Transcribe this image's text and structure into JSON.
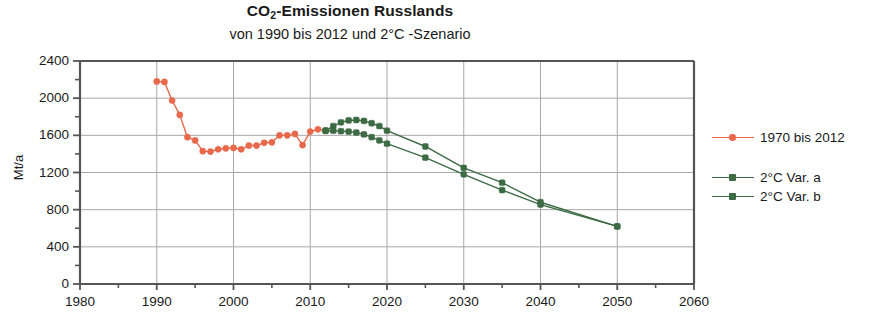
{
  "chart_data": {
    "type": "line",
    "title": "CO2-Emissionen Russlands",
    "title_main": "CO",
    "title_sub": "2",
    "title_rest": "-Emissionen Russlands",
    "subtitle": "von 1990 bis 2012 und 2°C -Szenario",
    "xlabel": "",
    "ylabel": "Mt/a",
    "xlim": [
      1980,
      2060
    ],
    "ylim": [
      0,
      2400
    ],
    "xticks": [
      1980,
      1990,
      2000,
      2010,
      2020,
      2030,
      2040,
      2050,
      2060
    ],
    "xtick_labels": [
      "1980",
      "1990",
      "2000",
      "2010",
      "2020",
      "2030",
      "2040",
      "2050",
      "2060"
    ],
    "xminor_step": 5,
    "yticks": [
      0,
      400,
      800,
      1200,
      1600,
      2000,
      2400
    ],
    "ytick_labels": [
      "0",
      "400",
      "800",
      "1200",
      "1600",
      "2000",
      "2400"
    ],
    "yminor_step": 200,
    "grid": "horizontal-and-vertical-major",
    "legend_position": "right",
    "colors": {
      "historical": "#e8684b",
      "scenario": "#3d6b44",
      "grid": "#a8a8a8",
      "axis": "#555555",
      "background": "#ffffff"
    },
    "series": [
      {
        "name": "1970 bis 2012",
        "color": "#e8684b",
        "x": [
          1990,
          1991,
          1992,
          1993,
          1994,
          1995,
          1996,
          1997,
          1998,
          1999,
          2000,
          2001,
          2002,
          2003,
          2004,
          2005,
          2006,
          2007,
          2008,
          2009,
          2010,
          2011,
          2012
        ],
        "values": [
          2180,
          2175,
          1975,
          1820,
          1580,
          1545,
          1430,
          1425,
          1450,
          1460,
          1465,
          1450,
          1490,
          1490,
          1520,
          1525,
          1600,
          1600,
          1615,
          1495,
          1640,
          1665,
          1650
        ]
      },
      {
        "name": "2°C Var. a",
        "color": "#3d6b44",
        "x": [
          2012,
          2013,
          2014,
          2015,
          2016,
          2017,
          2018,
          2019,
          2020,
          2025,
          2030,
          2035,
          2040,
          2050
        ],
        "values": [
          1650,
          1700,
          1740,
          1760,
          1765,
          1755,
          1730,
          1700,
          1650,
          1480,
          1250,
          1090,
          880,
          620
        ]
      },
      {
        "name": "2°C Var. b",
        "color": "#3d6b44",
        "x": [
          2012,
          2013,
          2014,
          2015,
          2016,
          2017,
          2018,
          2019,
          2020,
          2025,
          2030,
          2035,
          2040,
          2050
        ],
        "values": [
          1650,
          1650,
          1645,
          1640,
          1630,
          1610,
          1580,
          1545,
          1510,
          1360,
          1180,
          1010,
          855,
          620
        ]
      }
    ]
  },
  "legend": {
    "items": [
      {
        "label": "1970 bis 2012",
        "color": "#e8684b"
      },
      {
        "label": "2°C Var. a",
        "color": "#3d6b44"
      },
      {
        "label": "2°C Var. b",
        "color": "#3d6b44"
      }
    ]
  }
}
